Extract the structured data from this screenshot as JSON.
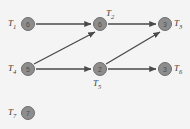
{
  "diagram": {
    "background_color": "#f4f4f4",
    "node_fill_color": "#8d8d8d",
    "node_stroke_color": "#6e6e6e",
    "edge_color": "#4a4a4a",
    "label_color": "#3b3b3b",
    "node_radius": 7,
    "nodes": [
      {
        "id": "T1",
        "label_t": "T",
        "label_sub": "1",
        "value": "6",
        "cx": 28,
        "cy": 24,
        "label_x": 8,
        "label_y": 19,
        "label_pos": "left"
      },
      {
        "id": "T2",
        "label_t": "T",
        "label_sub": "2",
        "value": "6",
        "cx": 100,
        "cy": 24,
        "label_x": 106,
        "label_y": 9,
        "label_pos": "top-right"
      },
      {
        "id": "T3",
        "label_t": "T",
        "label_sub": "3",
        "value": "3",
        "cx": 165,
        "cy": 24,
        "label_x": 174,
        "label_y": 19,
        "label_pos": "right"
      },
      {
        "id": "T4",
        "label_t": "T",
        "label_sub": "4",
        "value": "5",
        "cx": 28,
        "cy": 69,
        "label_x": 8,
        "label_y": 64,
        "label_pos": "left"
      },
      {
        "id": "T5",
        "label_t": "T",
        "label_sub": "5",
        "value": "2",
        "cx": 100,
        "cy": 69,
        "label_x": 93,
        "label_y": 79,
        "label_pos": "bottom"
      },
      {
        "id": "T6",
        "label_t": "T",
        "label_sub": "6",
        "value": "3",
        "cx": 165,
        "cy": 69,
        "label_x": 174,
        "label_y": 64,
        "label_pos": "right"
      },
      {
        "id": "T7",
        "label_t": "T",
        "label_sub": "7",
        "value": "7",
        "cx": 28,
        "cy": 113,
        "label_x": 8,
        "label_y": 108,
        "label_pos": "left"
      }
    ],
    "edges": [
      {
        "from": "T1",
        "to": "T2",
        "x1": 36,
        "y1": 24,
        "x2": 91,
        "y2": 24
      },
      {
        "from": "T2",
        "to": "T3",
        "x1": 108,
        "y1": 24,
        "x2": 156,
        "y2": 24
      },
      {
        "from": "T4",
        "to": "T2",
        "x1": 34,
        "y1": 64,
        "x2": 95,
        "y2": 32
      },
      {
        "from": "T4",
        "to": "T5",
        "x1": 36,
        "y1": 69,
        "x2": 91,
        "y2": 69
      },
      {
        "from": "T5",
        "to": "T3",
        "x1": 106,
        "y1": 64,
        "x2": 160,
        "y2": 32
      },
      {
        "from": "T5",
        "to": "T6",
        "x1": 108,
        "y1": 69,
        "x2": 156,
        "y2": 69
      }
    ]
  }
}
